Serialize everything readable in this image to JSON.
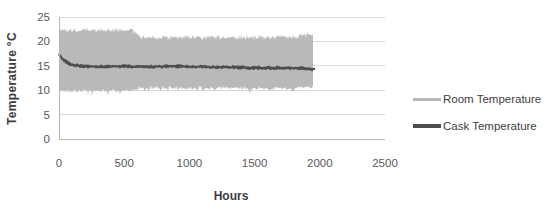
{
  "chart_data": {
    "type": "line",
    "title": "",
    "xlabel": "Hours",
    "ylabel": "Temperature °C",
    "xlim": [
      0,
      2500
    ],
    "ylim": [
      0,
      25
    ],
    "xticks": [
      0,
      500,
      1000,
      1500,
      2000,
      2500
    ],
    "yticks": [
      0,
      5,
      10,
      15,
      20,
      25
    ],
    "grid": "horizontal",
    "legend_position": "right",
    "colors": {
      "gridline": "#d9d9d9",
      "axis": "#b7b7b7",
      "tick_label": "#595959",
      "axis_title": "#3d3d3d",
      "legend_text": "#404040"
    },
    "series": [
      {
        "name": "Room Temperature",
        "style": "noisy-band",
        "color": "#b9b9b9",
        "x_end": 1950,
        "envelope": [
          {
            "x": 0,
            "min": 9.9,
            "max": 22.3
          },
          {
            "x": 560,
            "min": 9.9,
            "max": 22.3
          },
          {
            "x": 620,
            "min": 10.5,
            "max": 20.8
          },
          {
            "x": 1400,
            "min": 10.4,
            "max": 20.8
          },
          {
            "x": 1820,
            "min": 10.4,
            "max": 20.9
          },
          {
            "x": 1850,
            "min": 10.5,
            "max": 21.3
          },
          {
            "x": 1950,
            "min": 10.5,
            "max": 21.3
          }
        ]
      },
      {
        "name": "Cask Temperature",
        "style": "line",
        "color": "#4d4d4d",
        "x_end": 1950,
        "points": [
          [
            0,
            17.4
          ],
          [
            30,
            16.3
          ],
          [
            80,
            15.4
          ],
          [
            150,
            15.0
          ],
          [
            300,
            14.8
          ],
          [
            500,
            14.9
          ],
          [
            700,
            14.8
          ],
          [
            900,
            14.9
          ],
          [
            1100,
            14.8
          ],
          [
            1300,
            14.7
          ],
          [
            1500,
            14.6
          ],
          [
            1700,
            14.6
          ],
          [
            1850,
            14.5
          ],
          [
            1950,
            14.35
          ]
        ]
      }
    ]
  }
}
